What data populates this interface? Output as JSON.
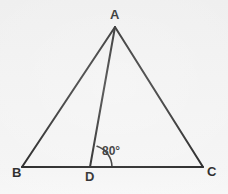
{
  "figure": {
    "kind": "geometry-diagram",
    "background_color": "#f1f1f1",
    "stroke_color": "#1a1a1a",
    "label_color": "#1d1d1d",
    "stroke_width": 2,
    "canvas": {
      "width": 228,
      "height": 194
    }
  },
  "points": {
    "A": {
      "label": "A",
      "x": 115,
      "y": 27
    },
    "B": {
      "label": "B",
      "x": 22,
      "y": 167
    },
    "C": {
      "label": "C",
      "x": 203,
      "y": 167
    },
    "D": {
      "label": "D",
      "x": 90,
      "y": 167
    }
  },
  "segments": [
    {
      "name": "AB",
      "from": "A",
      "to": "B"
    },
    {
      "name": "AC",
      "from": "A",
      "to": "C"
    },
    {
      "name": "BC",
      "from": "B",
      "to": "C"
    },
    {
      "name": "AD",
      "from": "A",
      "to": "D"
    }
  ],
  "angles": [
    {
      "name": "ADC",
      "vertex": "D",
      "value": "80°",
      "measure_degrees": 80,
      "arc_radius": 22
    }
  ]
}
